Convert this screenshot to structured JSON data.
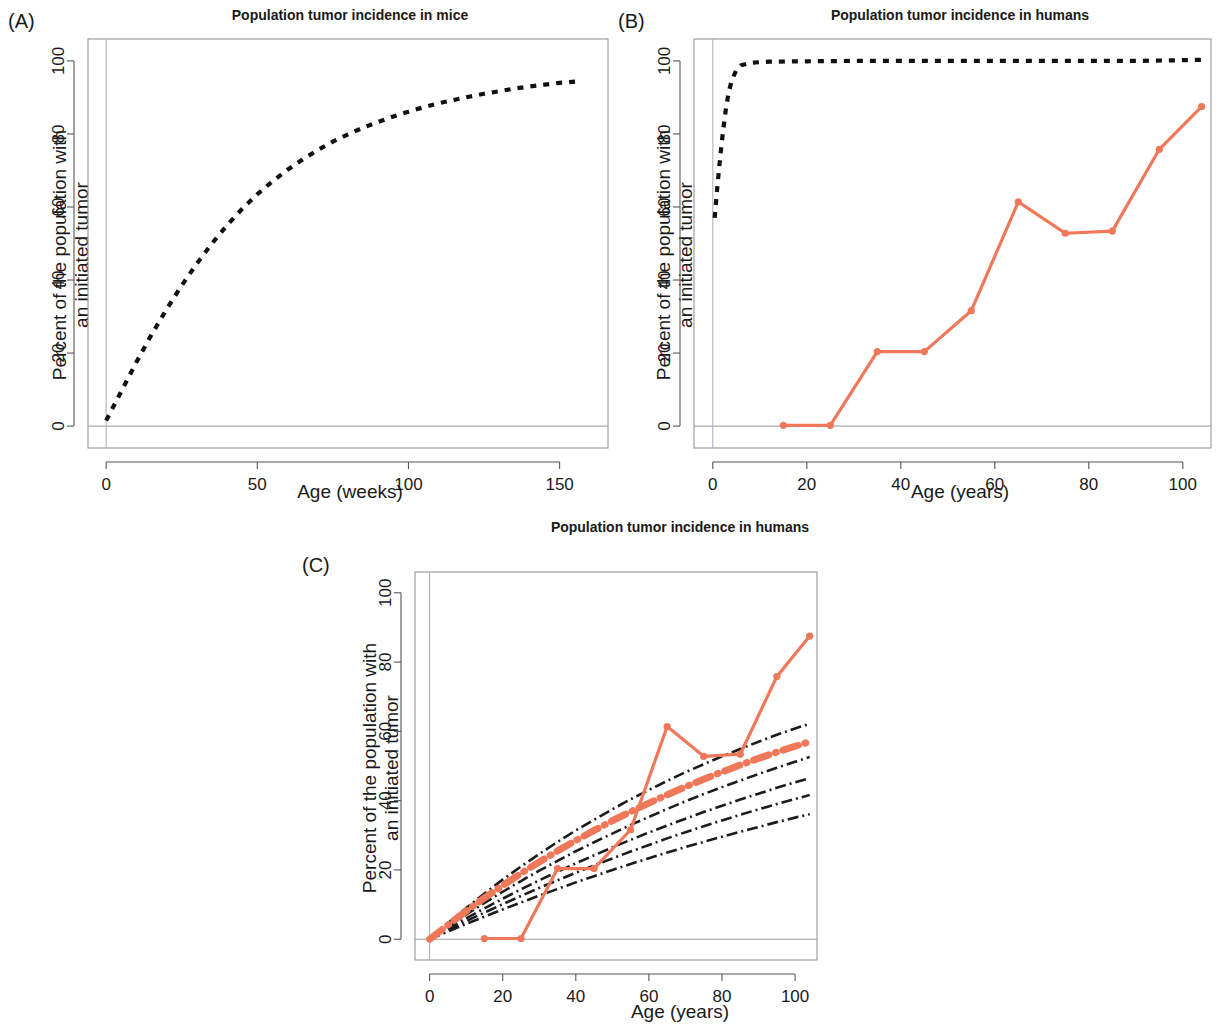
{
  "figure": {
    "background": "#ffffff",
    "accent_orange": "#F0785A",
    "curve_black": "#111111"
  },
  "panels": [
    {
      "id": "A",
      "label": "(A)",
      "title": "Population tumor incidence in mice",
      "xlabel": "Age (weeks)",
      "ylabel_line1": "Percent of the population with",
      "ylabel_line2": "an initiated tumor"
    },
    {
      "id": "B",
      "label": "(B)",
      "title": "Population tumor incidence in humans",
      "xlabel": "Age (years)",
      "ylabel_line1": "Percent of the population with",
      "ylabel_line2": "an initiated tumor"
    },
    {
      "id": "C",
      "label": "(C)",
      "title": "Population tumor incidence in humans",
      "xlabel": "Age (years)",
      "ylabel_line1": "Percent of the population with",
      "ylabel_line2": "an initiated tumor"
    }
  ],
  "chart_data": [
    {
      "panel": "A",
      "type": "line",
      "title": "Population tumor incidence in mice",
      "xlabel": "Age (weeks)",
      "ylabel": "Percent of the population with an initiated tumor",
      "xlim": [
        -6,
        166
      ],
      "ylim": [
        -6,
        106
      ],
      "xticks": [
        0,
        50,
        100,
        150
      ],
      "yticks": [
        0,
        20,
        40,
        60,
        80,
        100
      ],
      "grid": false,
      "legend": "none",
      "series": [
        {
          "name": "Modeled tumor initiation in mice",
          "style": "dashed",
          "color": "#111111",
          "x": [
            0,
            5,
            10,
            15,
            20,
            25,
            30,
            35,
            40,
            45,
            50,
            55,
            60,
            65,
            70,
            75,
            80,
            85,
            90,
            95,
            100,
            105,
            110,
            115,
            120,
            125,
            130,
            135,
            140,
            145,
            150,
            156
          ],
          "y": [
            1.5,
            9.5,
            17.5,
            25.0,
            32.0,
            38.5,
            44.5,
            50.0,
            55.0,
            59.5,
            63.5,
            67.0,
            70.2,
            73.0,
            75.6,
            77.9,
            79.9,
            81.7,
            83.3,
            84.8,
            86.1,
            87.3,
            88.4,
            89.3,
            90.2,
            91.0,
            91.7,
            92.4,
            93.0,
            93.5,
            94.0,
            94.4
          ]
        }
      ]
    },
    {
      "panel": "B",
      "type": "line",
      "title": "Population tumor incidence in humans",
      "xlabel": "Age (years)",
      "ylabel": "Percent of the population with an initiated tumor",
      "xlim": [
        -4,
        106
      ],
      "ylim": [
        -6,
        106
      ],
      "xticks": [
        0,
        20,
        40,
        60,
        80,
        100
      ],
      "yticks": [
        0,
        20,
        40,
        60,
        80,
        100
      ],
      "grid": false,
      "legend": "none",
      "series": [
        {
          "name": "Modeled tumor initiation (mouse-rate extrapolation)",
          "style": "dashed",
          "color": "#111111",
          "x": [
            0.4,
            1.0,
            1.6,
            2.2,
            2.8,
            3.4,
            4.0,
            5.0,
            6.0,
            8.0,
            12.0,
            20.0,
            30.0,
            40.0,
            50.0,
            60.0,
            70.0,
            80.0,
            90.0,
            100.0,
            104.0
          ],
          "y": [
            57.0,
            66.0,
            74.0,
            81.0,
            87.0,
            91.5,
            94.5,
            97.5,
            98.8,
            99.5,
            99.8,
            99.9,
            100.0,
            100.0,
            100.0,
            100.0,
            100.0,
            100.0,
            100.0,
            100.2,
            100.3
          ]
        },
        {
          "name": "Observed human tumor incidence (SEER)",
          "style": "solid-markers",
          "color": "#F0785A",
          "x": [
            15,
            25,
            35,
            45,
            55,
            65,
            75,
            85,
            95,
            104
          ],
          "y": [
            0.2,
            0.2,
            20.4,
            20.4,
            31.6,
            61.4,
            52.8,
            53.4,
            75.8,
            87.5
          ]
        }
      ]
    },
    {
      "panel": "C",
      "type": "line",
      "title": "Population tumor incidence in humans",
      "xlabel": "Age (years)",
      "ylabel": "Percent of the population with an initiated tumor",
      "xlim": [
        -4,
        106
      ],
      "ylim": [
        -6,
        106
      ],
      "xticks": [
        0,
        20,
        40,
        60,
        80,
        100
      ],
      "yticks": [
        0,
        20,
        40,
        60,
        80,
        100
      ],
      "grid": false,
      "legend": "none",
      "series": [
        {
          "name": "Model fit band upper bound",
          "style": "dashdot",
          "color": "#1c1c1c",
          "x": [
            0,
            5,
            10,
            15,
            20,
            25,
            30,
            35,
            40,
            45,
            50,
            55,
            60,
            65,
            70,
            75,
            80,
            85,
            90,
            95,
            100,
            104
          ],
          "y": [
            0.0,
            4.6,
            9.0,
            13.2,
            17.2,
            21.0,
            24.6,
            28.1,
            31.4,
            34.5,
            37.5,
            40.4,
            43.1,
            45.7,
            48.2,
            50.5,
            52.8,
            54.9,
            57.0,
            59.0,
            60.8,
            62.2
          ]
        },
        {
          "name": "Model fit curve 2",
          "style": "dashdot",
          "color": "#1c1c1c",
          "x": [
            0,
            5,
            10,
            15,
            20,
            25,
            30,
            35,
            40,
            45,
            50,
            55,
            60,
            65,
            70,
            75,
            80,
            85,
            90,
            95,
            100,
            104
          ],
          "y": [
            0.0,
            3.6,
            7.1,
            10.5,
            13.7,
            16.8,
            19.8,
            22.6,
            25.4,
            28.0,
            30.5,
            33.0,
            35.3,
            37.6,
            39.8,
            41.9,
            43.9,
            45.8,
            47.7,
            49.5,
            51.2,
            52.6
          ]
        },
        {
          "name": "Model fit curve 3",
          "style": "dashdot",
          "color": "#1c1c1c",
          "x": [
            0,
            5,
            10,
            15,
            20,
            25,
            30,
            35,
            40,
            45,
            50,
            55,
            60,
            65,
            70,
            75,
            80,
            85,
            90,
            95,
            100,
            104
          ],
          "y": [
            0.0,
            3.0,
            6.0,
            8.9,
            11.7,
            14.4,
            17.0,
            19.5,
            21.9,
            24.2,
            26.5,
            28.7,
            30.8,
            32.8,
            34.8,
            36.7,
            38.5,
            40.3,
            42.0,
            43.7,
            45.3,
            46.5
          ]
        },
        {
          "name": "Model fit curve 4",
          "style": "dashdot",
          "color": "#1c1c1c",
          "x": [
            0,
            5,
            10,
            15,
            20,
            25,
            30,
            35,
            40,
            45,
            50,
            55,
            60,
            65,
            70,
            75,
            80,
            85,
            90,
            95,
            100,
            104
          ],
          "y": [
            0.0,
            2.6,
            5.2,
            7.7,
            10.1,
            12.5,
            14.8,
            17.0,
            19.2,
            21.3,
            23.3,
            25.3,
            27.2,
            29.1,
            30.9,
            32.6,
            34.3,
            35.9,
            37.5,
            39.0,
            40.5,
            41.6
          ]
        },
        {
          "name": "Model fit band lower bound",
          "style": "dashdot",
          "color": "#1c1c1c",
          "x": [
            0,
            5,
            10,
            15,
            20,
            25,
            30,
            35,
            40,
            45,
            50,
            55,
            60,
            65,
            70,
            75,
            80,
            85,
            90,
            95,
            100,
            104
          ],
          "y": [
            0.0,
            2.2,
            4.4,
            6.5,
            8.6,
            10.6,
            12.6,
            14.5,
            16.4,
            18.2,
            20.0,
            21.7,
            23.4,
            25.0,
            26.6,
            28.1,
            29.6,
            31.0,
            32.4,
            33.8,
            35.1,
            36.1
          ]
        },
        {
          "name": "Best-fit model (human rate)",
          "style": "dashdot-accent",
          "color": "#F0785A",
          "x": [
            0,
            5,
            10,
            15,
            20,
            25,
            30,
            35,
            40,
            45,
            50,
            55,
            60,
            65,
            70,
            75,
            80,
            85,
            90,
            95,
            100,
            104
          ],
          "y": [
            0.0,
            4.1,
            8.1,
            11.9,
            15.5,
            19.0,
            22.3,
            25.5,
            28.5,
            31.4,
            34.2,
            36.8,
            39.3,
            41.7,
            44.0,
            46.2,
            48.3,
            50.3,
            52.2,
            54.0,
            55.7,
            57.0
          ]
        },
        {
          "name": "Observed human tumor incidence (SEER)",
          "style": "solid-markers",
          "color": "#F0785A",
          "x": [
            15,
            25,
            35,
            45,
            55,
            65,
            75,
            85,
            95,
            104
          ],
          "y": [
            0.2,
            0.2,
            20.4,
            20.4,
            31.6,
            61.4,
            52.8,
            53.4,
            75.8,
            87.5
          ]
        }
      ]
    }
  ]
}
